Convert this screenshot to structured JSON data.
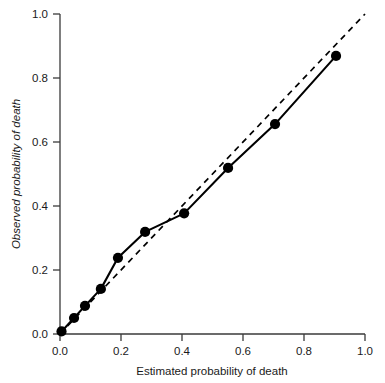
{
  "chart_data": {
    "type": "line",
    "title": "",
    "xlabel": "Estimated probability of death",
    "ylabel": "Observed probability of death",
    "xlim": [
      0.0,
      1.0
    ],
    "ylim": [
      0.0,
      1.0
    ],
    "grid": false,
    "legend": "none",
    "x_ticks": [
      "0.0",
      "0.2",
      "0.4",
      "0.6",
      "0.8",
      "1.0"
    ],
    "x_tick_values": [
      0.0,
      0.2,
      0.4,
      0.6,
      0.8,
      1.0
    ],
    "y_ticks": [
      "0.0",
      "0.2",
      "0.4",
      "0.6",
      "0.8",
      "1.0"
    ],
    "y_tick_values": [
      0.0,
      0.2,
      0.4,
      0.6,
      0.8,
      1.0
    ],
    "series": [
      {
        "name": "Calibration curve",
        "style": "solid-with-markers",
        "marker": "filled-circle",
        "color": "#000000",
        "x": [
          0.005,
          0.046,
          0.082,
          0.134,
          0.19,
          0.279,
          0.407,
          0.551,
          0.705,
          0.905
        ],
        "y": [
          0.008,
          0.05,
          0.088,
          0.141,
          0.238,
          0.319,
          0.377,
          0.519,
          0.656,
          0.869
        ]
      },
      {
        "name": "Perfect calibration reference",
        "style": "dashed",
        "marker": "none",
        "color": "#000000",
        "x": [
          0.0,
          1.0
        ],
        "y": [
          0.0,
          1.0
        ]
      }
    ]
  },
  "figure": {
    "caption": ""
  }
}
